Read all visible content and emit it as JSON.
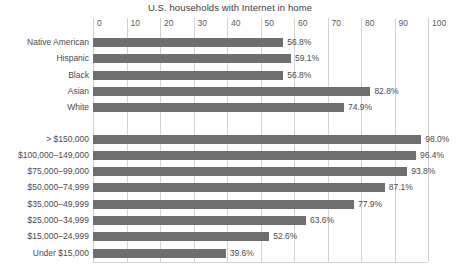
{
  "chart_data": {
    "type": "bar",
    "orientation": "horizontal",
    "title": "U.S. households with Internet in home",
    "xlabel": "",
    "ylabel": "",
    "xlim": [
      0,
      100
    ],
    "xticks": [
      0,
      10,
      20,
      30,
      40,
      50,
      60,
      70,
      80,
      90,
      100
    ],
    "xtick_labels": [
      "0",
      "10",
      "20",
      "30",
      "40",
      "50",
      "60",
      "70",
      "80",
      "90",
      "100"
    ],
    "grid": "vertical",
    "legend": "none",
    "bar_color": "#6e6e6e",
    "value_suffix": "%",
    "groups": [
      {
        "name": "race-ethnicity",
        "categories": [
          "Native American",
          "Hispanic",
          "Black",
          "Asian",
          "White"
        ],
        "values": [
          56.8,
          59.1,
          56.8,
          82.8,
          74.9
        ],
        "value_labels": [
          "56.8%",
          "59.1%",
          "56.8%",
          "82.8%",
          "74.9%"
        ]
      },
      {
        "name": "household-income",
        "categories": [
          "> $150,000",
          "$100,000–149,000",
          "$75,000–99,000",
          "$50,000–74,999",
          "$35,000–49,999",
          "$25,000–34,999",
          "$15,000–24,999",
          "Under $15,000"
        ],
        "values": [
          98.0,
          96.4,
          93.8,
          87.1,
          77.9,
          63.6,
          52.6,
          39.6
        ],
        "value_labels": [
          "98.0%",
          "96.4%",
          "93.8%",
          "87.1%",
          "77.9%",
          "63.6%",
          "52.6%",
          "39.6%"
        ]
      }
    ],
    "categories": [
      "Native American",
      "Hispanic",
      "Black",
      "Asian",
      "White",
      "> $150,000",
      "$100,000–149,000",
      "$75,000–99,000",
      "$50,000–74,999",
      "$35,000–49,999",
      "$25,000–34,999",
      "$15,000–24,999",
      "Under $15,000"
    ],
    "values": [
      56.8,
      59.1,
      56.8,
      82.8,
      74.9,
      98.0,
      96.4,
      93.8,
      87.1,
      77.9,
      63.6,
      52.6,
      39.6
    ]
  }
}
